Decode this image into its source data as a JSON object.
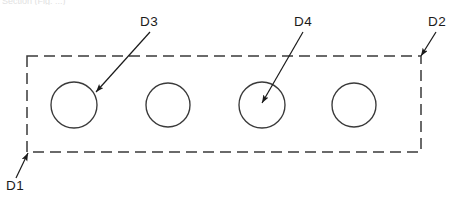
{
  "figure": {
    "type": "engineering-drawing",
    "background_color": "#ffffff",
    "line_color": "#1b1b1b",
    "outline_color": "#3a3a3a",
    "width": 460,
    "height": 205,
    "cropped_header_text": "Section (Fig. ...)",
    "plate": {
      "name": "dashed-rectangle",
      "style": "dashed",
      "x": 27,
      "y": 56,
      "width": 394,
      "height": 96,
      "dash": "11 6"
    },
    "holes": [
      {
        "id": "hole-1",
        "cx": 74,
        "cy": 105,
        "r": 23
      },
      {
        "id": "hole-2",
        "cx": 168,
        "cy": 105,
        "r": 22
      },
      {
        "id": "hole-3",
        "cx": 262,
        "cy": 105,
        "r": 23
      },
      {
        "id": "hole-4",
        "cx": 354,
        "cy": 105,
        "r": 22
      }
    ],
    "labels": [
      {
        "id": "D3",
        "text": "D3",
        "text_x": 140,
        "text_y": 26,
        "leader_x1": 150,
        "leader_y1": 32,
        "leader_x2": 96,
        "leader_y2": 92,
        "target": "hole-1"
      },
      {
        "id": "D4",
        "text": "D4",
        "text_x": 294,
        "text_y": 26,
        "leader_x1": 303,
        "leader_y1": 32,
        "leader_x2": 262,
        "leader_y2": 103,
        "target": "hole-3"
      },
      {
        "id": "D2",
        "text": "D2",
        "text_x": 428,
        "text_y": 26,
        "leader_x1": 436,
        "leader_y1": 32,
        "leader_x2": 421,
        "leader_y2": 56,
        "target": "plate-top-right-corner"
      },
      {
        "id": "D1",
        "text": "D1",
        "text_x": 6,
        "text_y": 190,
        "leader_x1": 16,
        "leader_y1": 178,
        "leader_x2": 28,
        "leader_y2": 153,
        "target": "plate-bottom-left-corner"
      }
    ]
  }
}
